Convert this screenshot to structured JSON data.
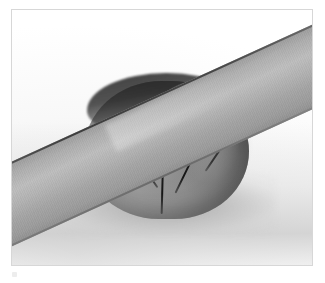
{
  "image": {
    "type": "photograph",
    "subject": "gray modeling clay ball being sliced by a flat metal blade",
    "caption": "",
    "background_color": "#ffffff",
    "frame_border_color": "#d7d7d7",
    "frame": {
      "x": 11,
      "y": 9,
      "width": 302,
      "height": 257
    }
  },
  "scene": {
    "backdrop": {
      "name": "white seamless surface",
      "color": "#f2f2f2"
    },
    "shadow": {
      "name": "cast shadow",
      "color": "#8a8a8a"
    },
    "objects": [
      {
        "name": "metal-blade",
        "label": "Flat metal blade",
        "color": "#b2b2b2",
        "edge_color": "#434343",
        "angle_degrees": -24.5,
        "description": "Long rectangular steel strip entering from lower left and exiting at upper right"
      },
      {
        "name": "clay-ball",
        "label": "Gray clay ball",
        "color": "#8a8a8a",
        "shadow_color": "#252525",
        "score_line_color": "#1a1a1a",
        "score_line_count": 4,
        "description": "Rounded putty mass deformed and scored by the descending blade"
      }
    ]
  },
  "artifact": {
    "name": "scan-artifact",
    "color": "#ededed"
  }
}
